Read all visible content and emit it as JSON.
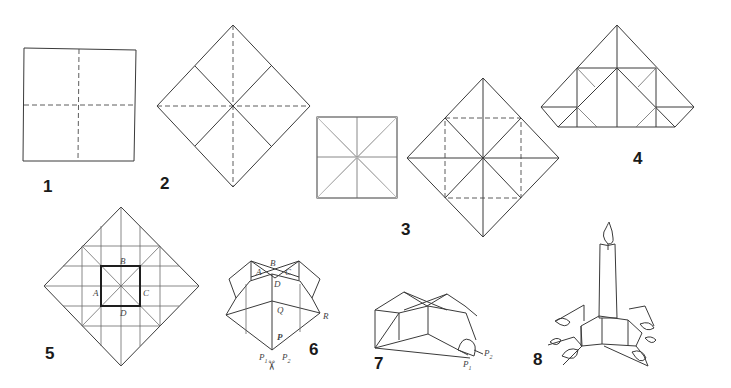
{
  "figure": {
    "steps": [
      {
        "number": "1",
        "caption": "Square with dashed center folds"
      },
      {
        "number": "2",
        "caption": "Diamond with valley creases"
      },
      {
        "number": "3",
        "caption": "Corners folded to center; diamond with dashed square"
      },
      {
        "number": "4",
        "caption": "Folded into triangle shape"
      },
      {
        "number": "5",
        "caption": "Crease pattern with central square",
        "labels": [
          "A",
          "B",
          "C",
          "D"
        ]
      },
      {
        "number": "6",
        "caption": "3D form with cut",
        "labels": [
          "A",
          "B",
          "C",
          "D",
          "Q",
          "R",
          "P",
          "P1",
          "P2"
        ],
        "icon": "scissors-icon"
      },
      {
        "number": "7",
        "caption": "Curling the flaps",
        "labels": [
          "P1",
          "P2"
        ]
      },
      {
        "number": "8",
        "caption": "Finished candle holder with candle"
      }
    ]
  },
  "labels": {
    "A": "A",
    "B": "B",
    "C": "C",
    "D": "D",
    "Q": "Q",
    "R": "R",
    "P": "P",
    "sub1": "1",
    "sub2": "2",
    "scissors": "✂"
  }
}
